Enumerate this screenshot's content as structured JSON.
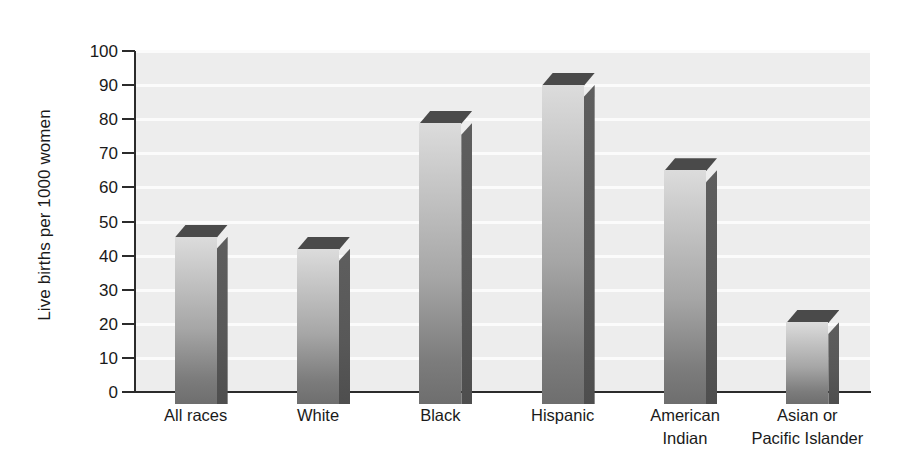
{
  "chart_data": {
    "type": "bar",
    "title": "",
    "subtitle": "",
    "xlabel": "",
    "ylabel": "Live births per 1000 women",
    "categories": [
      "All races",
      "White",
      "Black",
      "Hispanic",
      "American\nIndian",
      "Asian or\nPacific Islander"
    ],
    "values": [
      45.5,
      42,
      79,
      90,
      65,
      20.5
    ],
    "ylim": [
      0,
      100
    ],
    "ytick_labels": [
      "0",
      "10",
      "20",
      "30",
      "40",
      "50",
      "60",
      "70",
      "80",
      "90",
      "100"
    ],
    "ytick_values": [
      0,
      10,
      20,
      30,
      40,
      50,
      60,
      70,
      80,
      90,
      100
    ],
    "grid": "horizontal",
    "legend": "none",
    "style": "3d-columns",
    "colors": {
      "panel_background": "#ededed",
      "gridline": "#fbfbfb",
      "axis": "#2b2b2b",
      "bar_face_top": "#dcdcdc",
      "bar_face_bottom": "#6e6e6e",
      "bar_side": "#585858",
      "bar_top": "#4a4a4a",
      "text": "#1a1a1a",
      "page_background": "#ffffff"
    }
  }
}
